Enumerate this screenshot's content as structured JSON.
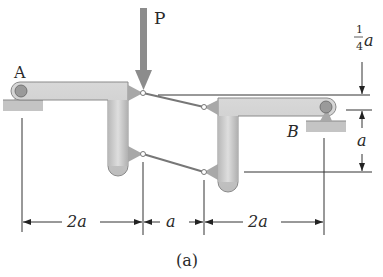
{
  "figure": {
    "caption": "(a)",
    "load_label": "P",
    "support_a_label": "A",
    "support_b_label": "B",
    "dims": {
      "top_offset": {
        "num": "1",
        "den": "4",
        "var": "a"
      },
      "right_height": "a",
      "bottom": [
        "2a",
        "a",
        "2a"
      ]
    },
    "colors": {
      "member": "#c9c9c9",
      "member_edge": "#8a8a8a",
      "load_arrow": "#8c8c8c",
      "ground": "#c4c4c4",
      "line": "#333333"
    }
  }
}
